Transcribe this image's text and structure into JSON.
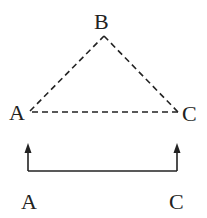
{
  "diagram": {
    "triangle": {
      "vertices": {
        "A": "A",
        "B": "B",
        "C": "C"
      },
      "edges": [
        [
          "A",
          "B"
        ],
        [
          "B",
          "C"
        ],
        [
          "A",
          "C"
        ]
      ],
      "style": "dashed"
    },
    "bottom": {
      "labels": {
        "left": "A",
        "right": "C"
      },
      "connector": "bracket with upward arrows"
    },
    "colors": {
      "stroke": "#222222",
      "background": "#ffffff"
    }
  }
}
